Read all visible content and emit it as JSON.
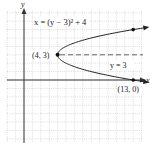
{
  "chart_data": {
    "type": "line",
    "title": "",
    "xlabel": "x",
    "ylabel": "y",
    "grid": true,
    "xlim": [
      -2,
      14
    ],
    "ylim": [
      -7.5,
      8
    ],
    "series": [
      {
        "name": "x = (y − 3)² + 4",
        "equation": "x = (y - 3)^2 + 4",
        "points": [
          [
            13,
            0
          ],
          [
            8,
            1
          ],
          [
            5,
            2
          ],
          [
            4,
            3
          ],
          [
            5,
            4
          ],
          [
            8,
            5
          ],
          [
            13,
            6
          ]
        ]
      },
      {
        "name": "y = 3",
        "style": "dashed",
        "points": [
          [
            4,
            3
          ],
          [
            14,
            3
          ]
        ]
      }
    ],
    "annotations": [
      {
        "text": "x = (y − 3)² + 4",
        "at": [
          2,
          7
        ]
      },
      {
        "text": "(4, 3)",
        "at": [
          4,
          3
        ]
      },
      {
        "text": "y = 3",
        "at": [
          11,
          2
        ]
      },
      {
        "text": "(13, 0)",
        "at": [
          13,
          0
        ]
      }
    ],
    "marked_points": [
      [
        4,
        3
      ],
      [
        13,
        6
      ],
      [
        13,
        0
      ]
    ]
  },
  "labels": {
    "equation": "x = (y − 3)² + 4",
    "vertex": "(4, 3)",
    "axis_of_symmetry": "y = 3",
    "x_intercept": "(13, 0)",
    "x_axis": "x",
    "y_axis": "y"
  }
}
